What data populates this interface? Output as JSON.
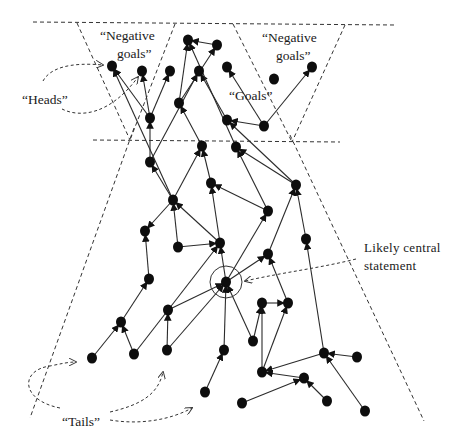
{
  "labels": {
    "negative_goals_left_line1": "“Negative",
    "negative_goals_left_line2": "goals”",
    "negative_goals_right_line1": "“Negative",
    "negative_goals_right_line2": "goals”",
    "goals": "“Goals”",
    "heads": "“Heads”",
    "tails": "“Tails”",
    "central_line1": "Likely central",
    "central_line2": "statement"
  },
  "colors": {
    "node": "#0d0d0d",
    "edge": "#2b2b2b",
    "background": "#ffffff"
  },
  "nodes": [
    {
      "id": "n1",
      "x": 112,
      "y": 66
    },
    {
      "id": "n2",
      "x": 142,
      "y": 71
    },
    {
      "id": "n3",
      "x": 170,
      "y": 71
    },
    {
      "id": "n4",
      "x": 188,
      "y": 40
    },
    {
      "id": "n5",
      "x": 217,
      "y": 45
    },
    {
      "id": "n6",
      "x": 199,
      "y": 71
    },
    {
      "id": "n7",
      "x": 227,
      "y": 67
    },
    {
      "id": "n8",
      "x": 274,
      "y": 79
    },
    {
      "id": "n9",
      "x": 312,
      "y": 67
    },
    {
      "id": "n10",
      "x": 150,
      "y": 118
    },
    {
      "id": "n11",
      "x": 179,
      "y": 103
    },
    {
      "id": "n12",
      "x": 227,
      "y": 120
    },
    {
      "id": "n13",
      "x": 264,
      "y": 126
    },
    {
      "id": "n14",
      "x": 150,
      "y": 162
    },
    {
      "id": "n15",
      "x": 202,
      "y": 146
    },
    {
      "id": "n16",
      "x": 236,
      "y": 147
    },
    {
      "id": "n17",
      "x": 173,
      "y": 200
    },
    {
      "id": "n18",
      "x": 211,
      "y": 183
    },
    {
      "id": "n19",
      "x": 268,
      "y": 211
    },
    {
      "id": "n20",
      "x": 296,
      "y": 185
    },
    {
      "id": "n21",
      "x": 145,
      "y": 231
    },
    {
      "id": "n22",
      "x": 178,
      "y": 247
    },
    {
      "id": "n23",
      "x": 220,
      "y": 243
    },
    {
      "id": "n24",
      "x": 306,
      "y": 239
    },
    {
      "id": "n25",
      "x": 226,
      "y": 282,
      "central": true
    },
    {
      "id": "n26",
      "x": 268,
      "y": 254
    },
    {
      "id": "n27",
      "x": 149,
      "y": 279
    },
    {
      "id": "n28",
      "x": 168,
      "y": 310
    },
    {
      "id": "n29",
      "x": 121,
      "y": 322
    },
    {
      "id": "n30",
      "x": 92,
      "y": 358
    },
    {
      "id": "n31",
      "x": 134,
      "y": 354
    },
    {
      "id": "n32",
      "x": 167,
      "y": 350
    },
    {
      "id": "n33",
      "x": 224,
      "y": 350
    },
    {
      "id": "n34",
      "x": 253,
      "y": 341
    },
    {
      "id": "n35",
      "x": 262,
      "y": 303
    },
    {
      "id": "n36",
      "x": 288,
      "y": 303
    },
    {
      "id": "n37",
      "x": 205,
      "y": 392
    },
    {
      "id": "n38",
      "x": 262,
      "y": 372
    },
    {
      "id": "n39",
      "x": 242,
      "y": 403
    },
    {
      "id": "n40",
      "x": 304,
      "y": 378
    },
    {
      "id": "n41",
      "x": 324,
      "y": 353
    },
    {
      "id": "n42",
      "x": 357,
      "y": 357
    },
    {
      "id": "n43",
      "x": 327,
      "y": 401
    },
    {
      "id": "n44",
      "x": 365,
      "y": 411
    }
  ],
  "edges": [
    [
      "n5",
      "n4"
    ],
    [
      "n10",
      "n1"
    ],
    [
      "n10",
      "n2"
    ],
    [
      "n10",
      "n3"
    ],
    [
      "n11",
      "n4"
    ],
    [
      "n11",
      "n5"
    ],
    [
      "n12",
      "n6"
    ],
    [
      "n13",
      "n7"
    ],
    [
      "n13",
      "n9"
    ],
    [
      "n13",
      "n12"
    ],
    [
      "n14",
      "n10"
    ],
    [
      "n14",
      "n6"
    ],
    [
      "n15",
      "n11"
    ],
    [
      "n16",
      "n4"
    ],
    [
      "n17",
      "n14"
    ],
    [
      "n17",
      "n15"
    ],
    [
      "n17",
      "n1"
    ],
    [
      "n17",
      "n21"
    ],
    [
      "n18",
      "n15"
    ],
    [
      "n19",
      "n18"
    ],
    [
      "n19",
      "n16"
    ],
    [
      "n20",
      "n12"
    ],
    [
      "n20",
      "n16"
    ],
    [
      "n22",
      "n17"
    ],
    [
      "n23",
      "n18"
    ],
    [
      "n23",
      "n17"
    ],
    [
      "n24",
      "n20"
    ],
    [
      "n25",
      "n23"
    ],
    [
      "n25",
      "n26"
    ],
    [
      "n25",
      "n19"
    ],
    [
      "n26",
      "n20"
    ],
    [
      "n27",
      "n21"
    ],
    [
      "n29",
      "n27"
    ],
    [
      "n30",
      "n29"
    ],
    [
      "n31",
      "n29"
    ],
    [
      "n31",
      "n23"
    ],
    [
      "n32",
      "n28"
    ],
    [
      "n32",
      "n25"
    ],
    [
      "n33",
      "n25"
    ],
    [
      "n34",
      "n25"
    ],
    [
      "n34",
      "n35"
    ],
    [
      "n35",
      "n36"
    ],
    [
      "n36",
      "n26"
    ],
    [
      "n38",
      "n35"
    ],
    [
      "n38",
      "n36"
    ],
    [
      "n37",
      "n33"
    ],
    [
      "n39",
      "n40"
    ],
    [
      "n41",
      "n38"
    ],
    [
      "n41",
      "n24"
    ],
    [
      "n42",
      "n41"
    ],
    [
      "n43",
      "n40"
    ],
    [
      "n44",
      "n41"
    ],
    [
      "n40",
      "n38"
    ],
    [
      "n22",
      "n23"
    ],
    [
      "n28",
      "n25"
    ]
  ]
}
